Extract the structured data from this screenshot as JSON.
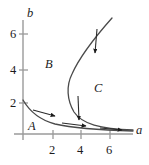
{
  "figure": {
    "title": "",
    "axes": {
      "x": {
        "label": "a",
        "label_x": 136,
        "label_y": 127,
        "ticks": [
          {
            "value": "2",
            "px": 53
          },
          {
            "value": "4",
            "px": 81
          },
          {
            "value": "6",
            "px": 110
          }
        ],
        "tick_label_y": 140,
        "axis_y_px": 134,
        "origin_x_px": 23,
        "end_x_px": 133
      },
      "y": {
        "label": "b",
        "label_x": 27,
        "label_y": 8,
        "ticks": [
          {
            "value": "2",
            "px": 103
          },
          {
            "value": "4",
            "px": 70
          },
          {
            "value": "6",
            "px": 34
          }
        ],
        "tick_label_x": 11,
        "axis_x_px": 23,
        "origin_y_px": 140,
        "end_y_px": 20
      }
    },
    "regions": [
      {
        "name": "A",
        "label": "A",
        "x": 28,
        "y": 122
      },
      {
        "name": "B",
        "label": "B",
        "x": 45,
        "y": 60
      },
      {
        "name": "C",
        "label": "C",
        "x": 94,
        "y": 84
      }
    ],
    "curves": [
      {
        "name": "hyperbola-curve",
        "description": "decreasing curve from near b=2 on the b-axis falling toward the a-axis",
        "path": "M 23,100 C 30,112 40,120 55,124 C 72,128 95,130 133,131"
      },
      {
        "name": "parabola-curve",
        "description": "curve opening upward-right with leftmost turning point near a=3.5,b=1.4",
        "path": "M 112,18 C 96,36 80,56 72,74 C 66,86 67,100 74,112 C 82,124 100,129 133,130"
      }
    ],
    "arrows": [
      {
        "name": "arrow-right-lower-left",
        "x1": 33,
        "y1": 110,
        "x2": 55,
        "y2": 116
      },
      {
        "name": "arrow-right-lower-mid",
        "x1": 65,
        "y1": 123,
        "x2": 86,
        "y2": 126
      },
      {
        "name": "arrow-right-lower-right",
        "x1": 100,
        "y1": 128,
        "x2": 122,
        "y2": 130
      },
      {
        "name": "arrow-down-mid",
        "x1": 78,
        "y1": 97,
        "x2": 79,
        "y2": 122
      },
      {
        "name": "arrow-down-upper",
        "x1": 96,
        "y1": 30,
        "x2": 94,
        "y2": 56
      }
    ],
    "colors": {
      "curve": "#4a4a4a",
      "axis": "#8c8c8c",
      "arrow": "#1b1b1b",
      "text": "#1b1b1b",
      "background": "#ffffff"
    }
  }
}
